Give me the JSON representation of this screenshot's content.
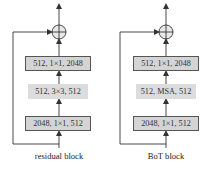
{
  "diagram": {
    "blocks": [
      {
        "name": "residual block",
        "caption": "residual block",
        "layers_top_to_bottom": [
          {
            "text": "512, 1×1, 2048",
            "style": "bordered"
          },
          {
            "text": "512, 3×3, 512",
            "style": "plain"
          },
          {
            "text": "2048, 1×1, 512",
            "style": "bordered"
          }
        ],
        "merge_op": "addition",
        "skip_connection": true
      },
      {
        "name": "BoT block",
        "caption": "BoT block",
        "layers_top_to_bottom": [
          {
            "text": "512, 1×1, 2048",
            "style": "bordered"
          },
          {
            "text": "512, MSA, 512",
            "style": "plain"
          },
          {
            "text": "2048, 1×1, 512",
            "style": "bordered"
          }
        ],
        "merge_op": "addition",
        "skip_connection": true
      }
    ],
    "colors": {
      "box_fill": "#d4d4d4",
      "box_border": "#555555",
      "line": "#333333"
    }
  }
}
